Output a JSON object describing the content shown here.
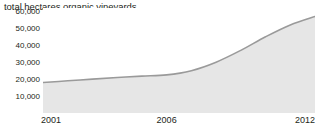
{
  "chart_data": {
    "type": "area",
    "title": "total hectares organic vineyards",
    "xlabel": "",
    "ylabel": "",
    "x": [
      2001,
      2002,
      2003,
      2004,
      2005,
      2006,
      2007,
      2008,
      2009,
      2010,
      2011,
      2012
    ],
    "values": [
      18000,
      19000,
      20000,
      21000,
      21800,
      22500,
      25000,
      30000,
      37000,
      45000,
      52000,
      57000
    ],
    "series": [
      {
        "name": "total hectares organic vineyards",
        "values": [
          18000,
          19000,
          20000,
          21000,
          21800,
          22500,
          25000,
          30000,
          37000,
          45000,
          52000,
          57000
        ]
      }
    ],
    "xlim": [
      2001,
      2012
    ],
    "ylim": [
      0,
      62000
    ],
    "y_ticks": [
      10000,
      20000,
      30000,
      40000,
      50000,
      60000
    ],
    "y_tick_labels": [
      "10,000",
      "20,000",
      "30,000",
      "40,000",
      "50,000",
      "60,000"
    ],
    "x_ticks": [
      2001,
      2006,
      2012
    ],
    "x_tick_labels": [
      "2001",
      "2006",
      "2012"
    ],
    "grid": false,
    "legend": "none",
    "line_color": "#9a9a9a",
    "fill_color": "#e6e6e6",
    "text_color": "#231f20",
    "background_color": "#ffffff"
  }
}
